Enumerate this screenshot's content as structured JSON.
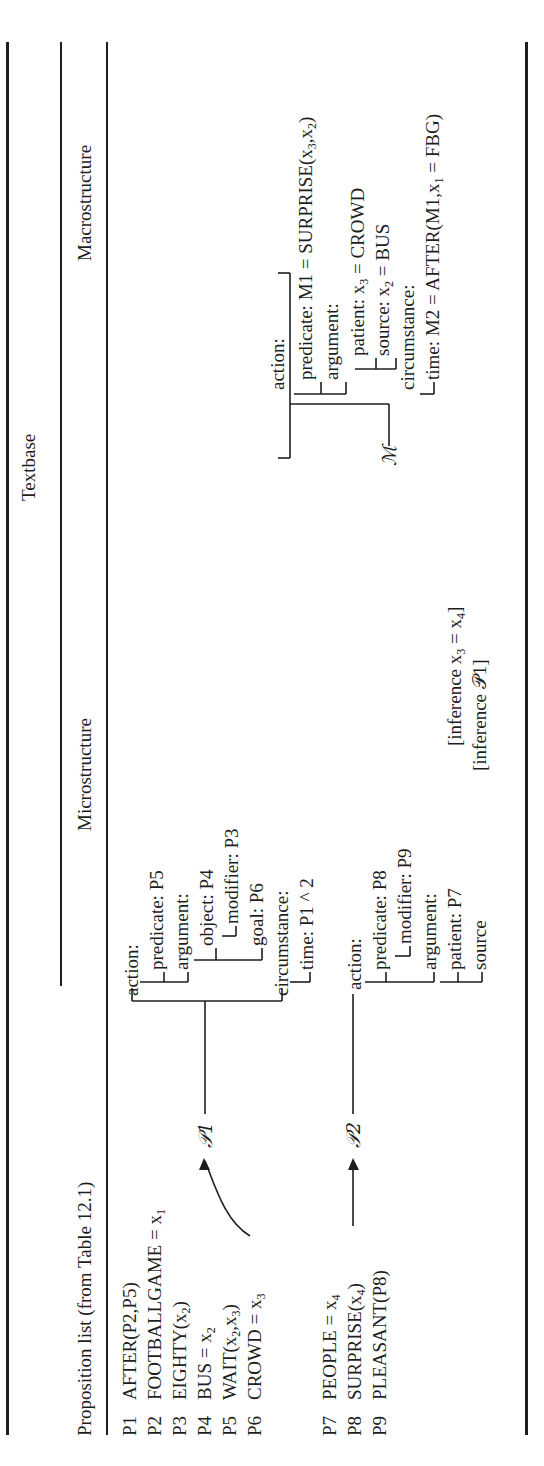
{
  "table": {
    "group_header": "Textbase",
    "columns": {
      "propositions": "Proposition list (from Table 12.1)",
      "micro": "Microstructure",
      "macro": "Macrostructure"
    },
    "propositions": [
      {
        "id": "P1",
        "text": "AFTER(P2,P5)"
      },
      {
        "id": "P2",
        "text": "FOOTBALLGAME = x",
        "sub": "1"
      },
      {
        "id": "P3",
        "text": "EIGHTY(x",
        "sub": "2",
        "tail": ")"
      },
      {
        "id": "P4",
        "text": "BUS = x",
        "sub": "2"
      },
      {
        "id": "P5",
        "text": "WAIT(x",
        "sub": "2",
        "mid": ",x",
        "sub2": "3",
        "tail": ")"
      },
      {
        "id": "P6",
        "text": "CROWD = x",
        "sub": "3"
      },
      {
        "id": "P7",
        "text": "PEOPLE = x",
        "sub": "4"
      },
      {
        "id": "P8",
        "text": "SURPRISE(x",
        "sub": "4",
        "tail": ")"
      },
      {
        "id": "P9",
        "text": "PLEASANT(P8)"
      }
    ],
    "micro_p1": {
      "label": "𝒫1",
      "lines": [
        "action:",
        "predicate: P5",
        "argument:",
        "object: P4",
        "modifier: P3",
        "goal: P6",
        "circumstance:",
        "time: P1 ^ 2"
      ]
    },
    "micro_p2": {
      "label": "𝒫2",
      "lines": [
        "action:",
        "predicate: P8",
        "modifier: P9",
        "argument:",
        "patient: P7",
        "source"
      ],
      "inference_1": "[inference x",
      "inference_1_sub": "3",
      "inference_1_tail": " = x",
      "inference_1_sub2": "4",
      "inference_1_end": "]",
      "inference_2": "[inference 𝒫1]"
    },
    "macro": {
      "label": "ℳ",
      "lines": {
        "action": "action:",
        "predicate": "predicate: M1 = SURPRISE(x",
        "predicate_sub1": "3",
        "predicate_mid": ",x",
        "predicate_sub2": "2",
        "predicate_end": ")",
        "argument": "argument:",
        "patient": "patient: x",
        "patient_sub": "3",
        "patient_end": " = CROWD",
        "source": "source: x",
        "source_sub": "2",
        "source_end": " = BUS",
        "circumstance": "circumstance:",
        "time": "time: M2 = AFTER(M1,x",
        "time_sub": "1",
        "time_end": " = FBG)"
      }
    }
  }
}
